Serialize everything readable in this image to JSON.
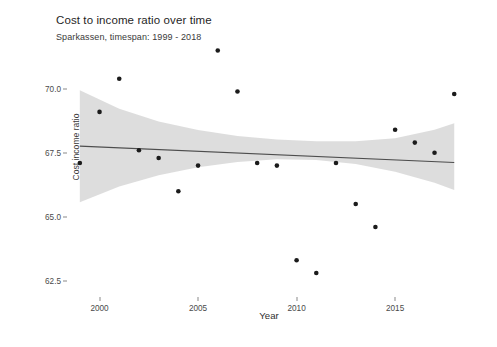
{
  "chart_data": {
    "type": "scatter",
    "title": "Cost to income ratio over time",
    "subtitle": "Sparkassen, timespan: 1999 - 2018",
    "xlabel": "Year",
    "ylabel": "Cost income ratio",
    "xlim": [
      1998.4,
      2018.8
    ],
    "ylim": [
      61.9,
      71.6
    ],
    "xticks": [
      2000,
      2005,
      2010,
      2015
    ],
    "xtick_labels": [
      "2000",
      "2005",
      "2010",
      "2015"
    ],
    "yticks": [
      70.0,
      67.5,
      65.0,
      62.5
    ],
    "ytick_labels": [
      "70.0",
      "67.5",
      "65.0",
      "62.5"
    ],
    "grid": false,
    "legend": null,
    "point_color": "#1b1b1b",
    "line_color": "#4d4d4d",
    "ribbon_color": "#d0d0d0",
    "background": "#ffffff",
    "x": [
      1999,
      2000,
      2001,
      2002,
      2003,
      2004,
      2005,
      2006,
      2007,
      2008,
      2009,
      2010,
      2011,
      2012,
      2013,
      2014,
      2015,
      2016,
      2017,
      2018
    ],
    "y": [
      67.1,
      69.1,
      70.4,
      67.6,
      67.3,
      66.0,
      67.0,
      71.5,
      69.9,
      67.1,
      67.0,
      63.3,
      62.8,
      67.1,
      65.5,
      64.6,
      68.4,
      67.9,
      67.5,
      69.8
    ],
    "series": [
      {
        "name": "Cost income ratio",
        "values": [
          67.1,
          69.1,
          70.4,
          67.6,
          67.3,
          66.0,
          67.0,
          71.5,
          69.9,
          67.1,
          67.0,
          63.3,
          62.8,
          67.1,
          65.5,
          64.6,
          68.4,
          67.9,
          67.5,
          69.8
        ]
      }
    ],
    "trend": {
      "type": "linear-regression",
      "x": [
        1999,
        2018
      ],
      "y": [
        67.76,
        67.12
      ],
      "confidence_band": {
        "level": 0.95,
        "x": [
          1999,
          2001,
          2003,
          2005,
          2007,
          2009,
          2011,
          2013,
          2015,
          2017,
          2018
        ],
        "upper": [
          69.95,
          69.22,
          68.73,
          68.39,
          68.16,
          68.02,
          67.95,
          67.95,
          68.07,
          68.4,
          68.66
        ],
        "lower": [
          65.57,
          66.18,
          66.62,
          66.94,
          67.14,
          67.25,
          67.22,
          67.06,
          66.76,
          66.33,
          66.05
        ]
      }
    }
  }
}
